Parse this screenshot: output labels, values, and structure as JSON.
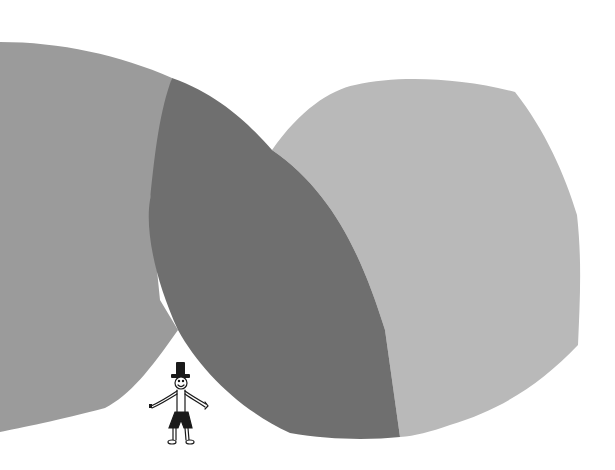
{
  "illustration": {
    "description": "Two large overlapping gray blob shapes with a small stick figure wearing a tall hat standing beneath them",
    "colors": {
      "background": "#ffffff",
      "left_blob": "#9b9b9b",
      "overlap_lens": "#6f6f6f",
      "right_blob": "#b9b9b9",
      "figure_ink": "#1a1a1a"
    },
    "figure": {
      "label": "stick figure with top hat",
      "parts": [
        "hat",
        "head",
        "arms",
        "torso",
        "shorts",
        "legs",
        "feet"
      ]
    }
  }
}
